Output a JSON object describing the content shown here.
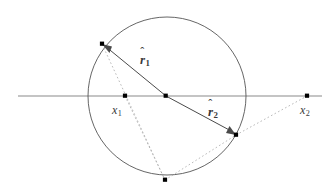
{
  "figure": {
    "type": "geometry-diagram",
    "width": 330,
    "height": 191,
    "background_color": "#ffffff",
    "colors": {
      "circle_stroke": "#555555",
      "axis_stroke": "#b0b0b0",
      "vector_stroke": "#4a4a4a",
      "dotted_stroke": "#a8a8a8",
      "point_fill": "#000000",
      "label_color": "#3a3a3a"
    },
    "circle": {
      "center_x": 167,
      "center_y": 96,
      "radius": 79
    },
    "axis": {
      "y": 96,
      "x_start": 18,
      "x_end": 322
    },
    "points": {
      "center": {
        "x": 166,
        "y": 96
      },
      "x1": {
        "x": 125,
        "y": 96
      },
      "x2": {
        "x": 307,
        "y": 96
      },
      "upper_left_vertex": {
        "x": 102,
        "y": 44
      },
      "lower_right_vertex": {
        "x": 236,
        "y": 135
      },
      "bottom_vertex": {
        "x": 165,
        "y": 180
      }
    },
    "vectors": [
      {
        "name": "r1",
        "from": "center",
        "to": "upper_left_vertex",
        "label_base": "r",
        "label_hat": "ˆ",
        "label_sub": "1",
        "label_x": 140,
        "label_y": 53
      },
      {
        "name": "r2",
        "from": "center",
        "to": "lower_right_vertex",
        "label_base": "r",
        "label_hat": "ˆ",
        "label_sub": "2",
        "label_x": 208,
        "label_y": 105
      }
    ],
    "point_labels": [
      {
        "name": "x1",
        "label_base": "x",
        "label_sub": "1",
        "label_x": 112,
        "label_y": 104
      },
      {
        "name": "x2",
        "label_base": "x",
        "label_sub": "2",
        "label_x": 300,
        "label_y": 104
      }
    ],
    "dotted_lines": [
      {
        "name": "bottom-to-upper-left",
        "from": "bottom_vertex",
        "to": "upper_left_vertex"
      },
      {
        "name": "bottom-to-lower-right",
        "from": "bottom_vertex",
        "to": "lower_right_vertex"
      },
      {
        "name": "lower-right-to-x2",
        "from": "lower_right_vertex",
        "to": "x2"
      },
      {
        "name": "x1-to-bottom",
        "from": "x1",
        "to": "bottom_vertex"
      }
    ]
  }
}
